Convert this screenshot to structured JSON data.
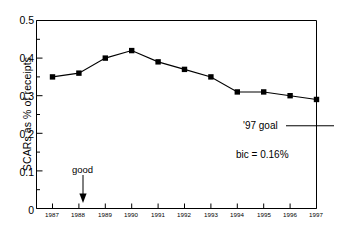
{
  "chart": {
    "type": "line",
    "ylabel": "SCARs as % of receipts",
    "xlabel": "",
    "title": "",
    "annotations": {
      "goal_label": "'97 goal",
      "bic_label": "bic = 0.16%",
      "good_label": "good"
    }
  },
  "chart_data": {
    "type": "line",
    "title": "",
    "xlabel": "",
    "ylabel": "SCARs as % of receipts",
    "categories": [
      "1987",
      "1988",
      "1989",
      "1990",
      "1991",
      "1992",
      "1993",
      "1994",
      "1995",
      "1996",
      "1997"
    ],
    "values": [
      0.35,
      0.36,
      0.4,
      0.42,
      0.39,
      0.37,
      0.35,
      0.31,
      0.31,
      0.3,
      0.29
    ],
    "ylim": [
      0,
      0.5
    ],
    "yticks": [
      "0",
      "0.1",
      "0.2",
      "0.3",
      "0.4",
      "0.5"
    ],
    "ytick_values": [
      0,
      0.1,
      0.2,
      0.3,
      0.4,
      0.5
    ],
    "xticks": [
      "1987",
      "1988",
      "1989",
      "1990",
      "1991",
      "1992",
      "1993",
      "1994",
      "1995",
      "1996",
      "1997"
    ],
    "grid": false,
    "legend": "none",
    "marker": "square",
    "series_color": "#000000",
    "annotations": [
      {
        "text": "'97 goal",
        "value": 0.22,
        "kind": "reference-line"
      },
      {
        "text": "bic = 0.16%",
        "kind": "text"
      },
      {
        "text": "good",
        "kind": "arrow",
        "points_to": "1988",
        "direction": "down"
      }
    ]
  },
  "axis": {
    "line_color": "#000000",
    "frame": true
  }
}
